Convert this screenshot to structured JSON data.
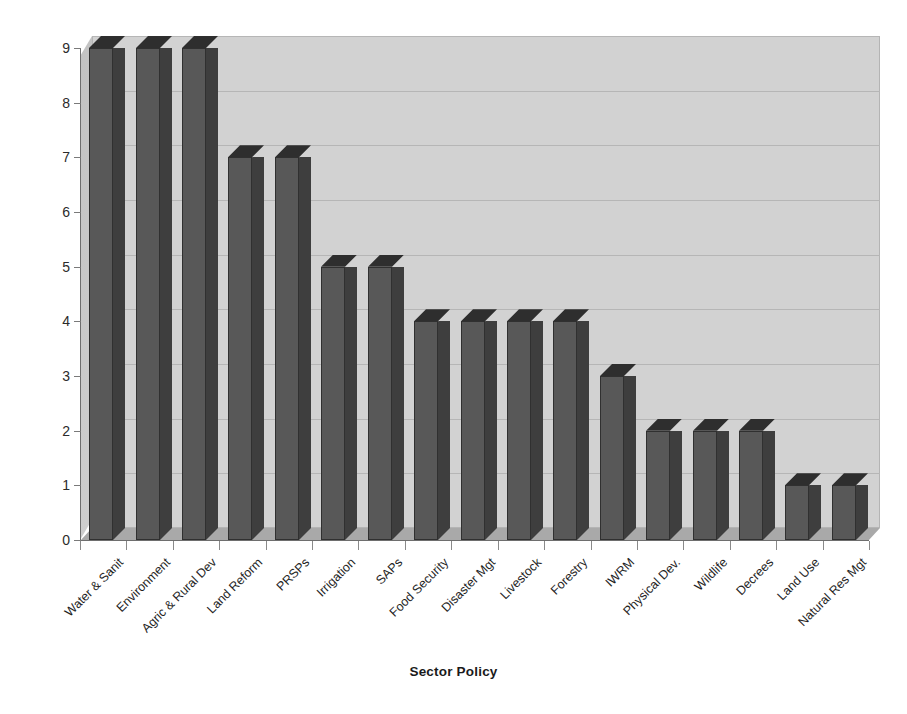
{
  "chart_data": {
    "type": "bar",
    "title": "",
    "xlabel": "Sector Policy",
    "ylabel": "No. of Countries",
    "ylim": [
      0,
      9
    ],
    "yticks": [
      0,
      1,
      2,
      3,
      4,
      5,
      6,
      7,
      8,
      9
    ],
    "grid": true,
    "legend": false,
    "style_3d": true,
    "categories": [
      "Water & Sanit",
      "Environment",
      "Agric & Rural Dev",
      "Land Reform",
      "PRSPs",
      "Irrigation",
      "SAPs",
      "Food Security",
      "Disaster Mgt",
      "Livestock",
      "Forestry",
      "IWRM",
      "Physical Dev.",
      "Wildlife",
      "Decrees",
      "Land Use",
      "Natural Res Mgt"
    ],
    "values": [
      9,
      9,
      9,
      7,
      7,
      5,
      5,
      4,
      4,
      4,
      4,
      3,
      2,
      2,
      2,
      1,
      1
    ]
  },
  "colors": {
    "bar_front": "#585858",
    "bar_side": "#3e3e3e",
    "bar_top": "#2e2e2e",
    "plot_wall": "#d2d2d2",
    "plot_floor": "#a9a9a9",
    "gridline": "#b6b6b6",
    "axis": "#6e6e6e",
    "text": "#1a1a1a",
    "background": "#ffffff"
  }
}
